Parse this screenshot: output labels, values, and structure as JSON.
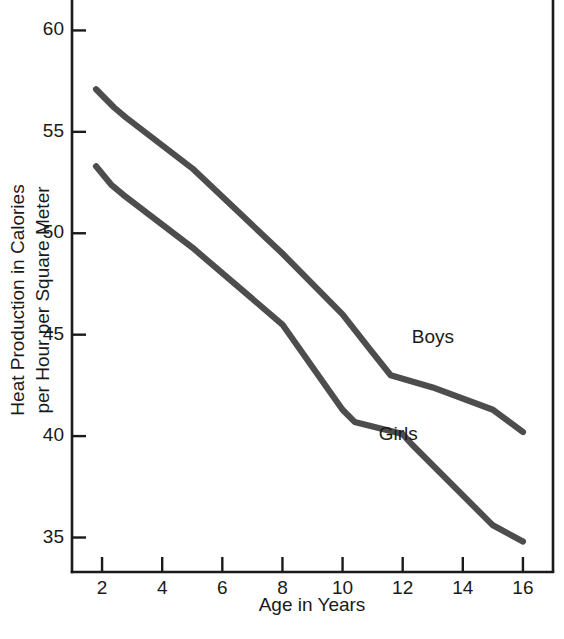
{
  "chart_data": {
    "type": "line",
    "title": "",
    "subtitle": "",
    "xlabel": "Age in Years",
    "ylabel": "Heat Production in Calories per Hour per Square Meter",
    "ylabel_line1": "Heat Production in Calories",
    "ylabel_line2": "per Hour per Square Meter",
    "xlim": [
      1.0,
      17.0
    ],
    "ylim": [
      33.3,
      61.5
    ],
    "xticks": [
      2,
      4,
      6,
      8,
      10,
      12,
      14,
      16
    ],
    "xtick_labels": [
      "2",
      "4",
      "6",
      "8",
      "10",
      "12",
      "14",
      "16"
    ],
    "yticks": [
      35,
      40,
      45,
      50,
      55,
      60
    ],
    "ytick_labels": [
      "35",
      "40",
      "45",
      "50",
      "55",
      "60"
    ],
    "grid": false,
    "legend_position": "inline-annotation",
    "series": [
      {
        "name": "Boys",
        "color": "#4d4d4d",
        "label_x": 12.3,
        "label_y": 44.6,
        "x": [
          1.8,
          2.4,
          2.8,
          5.0,
          8.0,
          10.0,
          10.9,
          11.6,
          13.0,
          15.0,
          16.0
        ],
        "values": [
          57.1,
          56.2,
          55.7,
          53.2,
          49.0,
          46.0,
          44.3,
          43.0,
          42.4,
          41.3,
          40.2
        ]
      },
      {
        "name": "Girls",
        "color": "#4d4d4d",
        "label_x": 11.2,
        "label_y": 39.8,
        "x": [
          1.8,
          2.3,
          2.7,
          5.0,
          8.0,
          10.0,
          10.4,
          12.0,
          12.3,
          15.0,
          16.0
        ],
        "values": [
          53.3,
          52.4,
          51.9,
          49.3,
          45.5,
          41.3,
          40.7,
          40.1,
          39.6,
          35.6,
          34.8
        ]
      }
    ],
    "annotations": [
      {
        "text": "Boys",
        "x": 12.3,
        "y": 44.6
      },
      {
        "text": "Girls",
        "x": 11.2,
        "y": 39.8
      }
    ]
  }
}
